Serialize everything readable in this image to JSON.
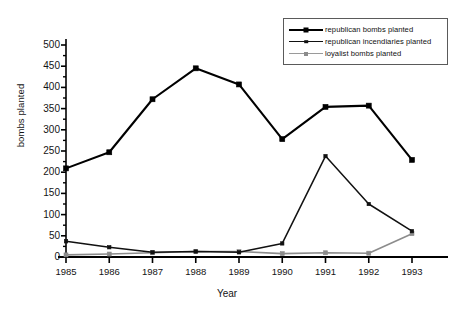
{
  "chart_data": {
    "type": "line",
    "title": "",
    "xlabel": "Year",
    "ylabel": "bombs planted",
    "categories": [
      "1985",
      "1986",
      "1987",
      "1988",
      "1989",
      "1990",
      "1991",
      "1992",
      "1993"
    ],
    "x": [
      1985,
      1986,
      1987,
      1988,
      1989,
      1990,
      1991,
      1992,
      1993
    ],
    "xlim": [
      1985,
      1993
    ],
    "ylim": [
      0,
      500
    ],
    "yticks": [
      0,
      50,
      100,
      150,
      200,
      250,
      300,
      350,
      400,
      450,
      500
    ],
    "ytick_labels": [
      "0",
      "50",
      "100",
      "150",
      "200",
      "250",
      "300",
      "350",
      "400",
      "450",
      "500"
    ],
    "y_minor_tick_step": 25,
    "grid": false,
    "legend_position": "top-right",
    "series": [
      {
        "name": "republican bombs planted",
        "color": "#000000",
        "marker": "square",
        "marker_size": 5,
        "line_width": 2.1,
        "values": [
          209,
          247,
          372,
          445,
          407,
          278,
          354,
          357,
          229
        ]
      },
      {
        "name": "republican incendiaries planted",
        "color": "#111111",
        "marker": "square",
        "marker_size": 3.4,
        "line_width": 1.5,
        "values": [
          37,
          23,
          11,
          13,
          11,
          32,
          238,
          125,
          61
        ]
      },
      {
        "name": "loyalist bombs planted",
        "color": "#8c8c8c",
        "marker": "square",
        "marker_size": 4,
        "line_width": 1.6,
        "values": [
          5,
          7,
          10,
          13,
          13,
          8,
          10,
          9,
          55
        ]
      }
    ]
  },
  "axes": {
    "axis_color": "#000000",
    "background": "#ffffff"
  }
}
